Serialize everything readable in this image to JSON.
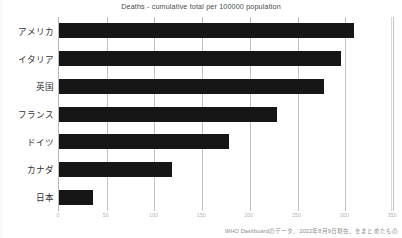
{
  "chart_data": {
    "type": "bar",
    "orientation": "horizontal",
    "title": "Deaths - cumulative total per 100000 population",
    "xlabel": "",
    "ylabel": "",
    "categories": [
      "アメリカ",
      "イタリア",
      "英国",
      "フランス",
      "ドイツ",
      "カナダ",
      "日本"
    ],
    "values": [
      309,
      296,
      278,
      228,
      178,
      118,
      36
    ],
    "series": [
      {
        "name": "Deaths - cumulative total per 100000 population",
        "values": [
          309,
          296,
          278,
          228,
          178,
          118,
          36
        ]
      }
    ],
    "xlim": [
      0,
      350
    ],
    "xticks": [
      0,
      50,
      100,
      150,
      200,
      250,
      300,
      350
    ],
    "xtick_labels": [
      "0",
      "50",
      "100",
      "150",
      "200",
      "250",
      "300",
      "350"
    ],
    "grid": true,
    "grid_axis": "x",
    "legend": false,
    "bar_color": "#161616"
  },
  "source_note": "WHO Dashboardのデータ、2022年8月9日現在、をまとめたもの",
  "colors": {
    "bar": "#161616",
    "grid": "#c2c2c2",
    "title_text": "#4a4a4a",
    "category_text": "#333333",
    "tick_text": "#b6b6b6",
    "note_text": "#8d8d8d",
    "background": "#ffffff"
  }
}
